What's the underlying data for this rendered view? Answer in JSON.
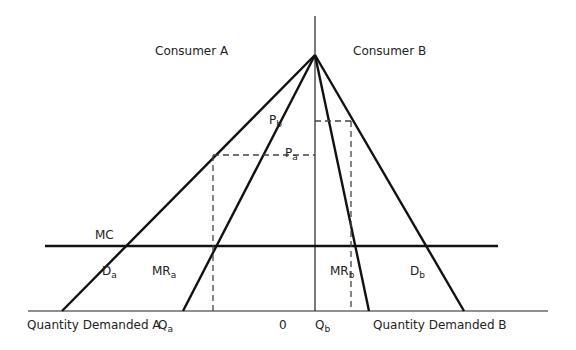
{
  "labels": {
    "consumer_a": "Consumer A",
    "consumer_b": "Consumer B",
    "pb": "P",
    "pb_sub": "b",
    "pa": "P",
    "pa_sub": "a",
    "mc": "MC",
    "da": "D",
    "da_sub": "a",
    "mra": "MR",
    "mra_sub": "a",
    "mrb": "MR",
    "mrb_sub": "b",
    "db": "D",
    "db_sub": "b",
    "qda": "Quantity Demanded A",
    "qa": "Q",
    "qa_sub": "a",
    "zero": "0",
    "qb": "Q",
    "qb_sub": "b",
    "qdb": "Quantity Demanded B"
  },
  "colors": {
    "line": "#111111",
    "dash": "#444444"
  }
}
